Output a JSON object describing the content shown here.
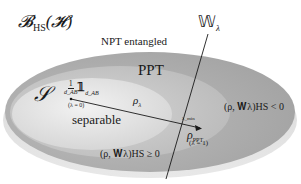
{
  "diagram": {
    "title_main": "𝓑",
    "title_sub": "HS",
    "title_arg": "(𝓗)",
    "witness_label": "𝕎",
    "witness_sub": "λ",
    "regions": {
      "outer": {
        "label": "NPT entangled",
        "color": "#a9a9a9"
      },
      "ppt": {
        "label": "PPT",
        "color": "#c4c4c4"
      },
      "separable": {
        "label": "separable",
        "symbol": "𝒮",
        "color": "#e2e2e2"
      }
    },
    "points": {
      "maximally_mixed": {
        "num": "1",
        "den": "d_AB",
        "op": "𝟙",
        "op_sub": "d_AB",
        "param": "(λ = 0)"
      },
      "rho_lambda": {
        "label": "ρ",
        "sub": "λ"
      },
      "lambda_min": {
        "label": "λ_min"
      },
      "rho_ppt": {
        "label": "ρ",
        "sub": "PPT",
        "param": "(λ = 1)"
      }
    },
    "inequalities": {
      "negative": "(ρ, 𝐖λ)HS < 0",
      "nonnegative": "(ρ, 𝐖λ)HS ≥ 0"
    },
    "colors": {
      "background": "#ffffff",
      "outer_ellipse": "#a9a9a9",
      "ppt_ellipse": "#c4c4c4",
      "separable_ellipse": "#e2e2e2",
      "lines": "#1a1a1a"
    }
  }
}
